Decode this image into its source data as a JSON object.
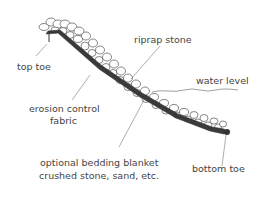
{
  "diagram": {
    "type": "riprap slope cross-section",
    "labels": {
      "top_toe": "top toe",
      "riprap_stone": "riprap stone",
      "water_level": "water level",
      "erosion_fabric_line1": "erosion control",
      "erosion_fabric_line2": "fabric",
      "bedding_line1": "optional bedding blanket",
      "bedding_line2": "crushed stone, sand, etc.",
      "bottom_toe": "bottom toe"
    },
    "colors": {
      "line": "#555555",
      "text": "#444444",
      "fabric": "#333333"
    }
  }
}
